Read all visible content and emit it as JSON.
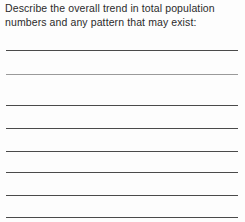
{
  "document": {
    "type": "worksheet-question",
    "background_color": "#fdfdfd",
    "text_color": "#2b2b2b",
    "rule_color": "#4a4a4a",
    "rule_color_light": "#9a9a9a"
  },
  "question": {
    "prompt": "Describe the overall trend in total population numbers and any pattern that may exist:",
    "prompt_line_1": "Describe the overall trend in total population",
    "prompt_line_2": "numbers and any pattern that may exist:"
  },
  "answer_area": {
    "line_count": 8,
    "lines": [
      {
        "index": 1,
        "y": 50,
        "shade": "dark"
      },
      {
        "index": 2,
        "y": 74,
        "shade": "light"
      },
      {
        "index": 3,
        "y": 105,
        "shade": "dark"
      },
      {
        "index": 4,
        "y": 128,
        "shade": "dark"
      },
      {
        "index": 5,
        "y": 151,
        "shade": "dark"
      },
      {
        "index": 6,
        "y": 172,
        "shade": "dark"
      },
      {
        "index": 7,
        "y": 195,
        "shade": "dark"
      },
      {
        "index": 8,
        "y": 217,
        "shade": "dark"
      }
    ]
  }
}
